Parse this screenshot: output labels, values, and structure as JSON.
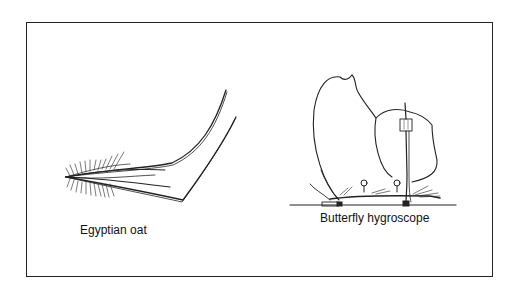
{
  "figure": {
    "panels": [
      {
        "id": "egyptian-oat",
        "caption": "Egyptian oat"
      },
      {
        "id": "butterfly-hygroscope",
        "caption": "Butterfly hygroscope"
      }
    ]
  },
  "colors": {
    "line": "#222222",
    "background": "#ffffff"
  }
}
